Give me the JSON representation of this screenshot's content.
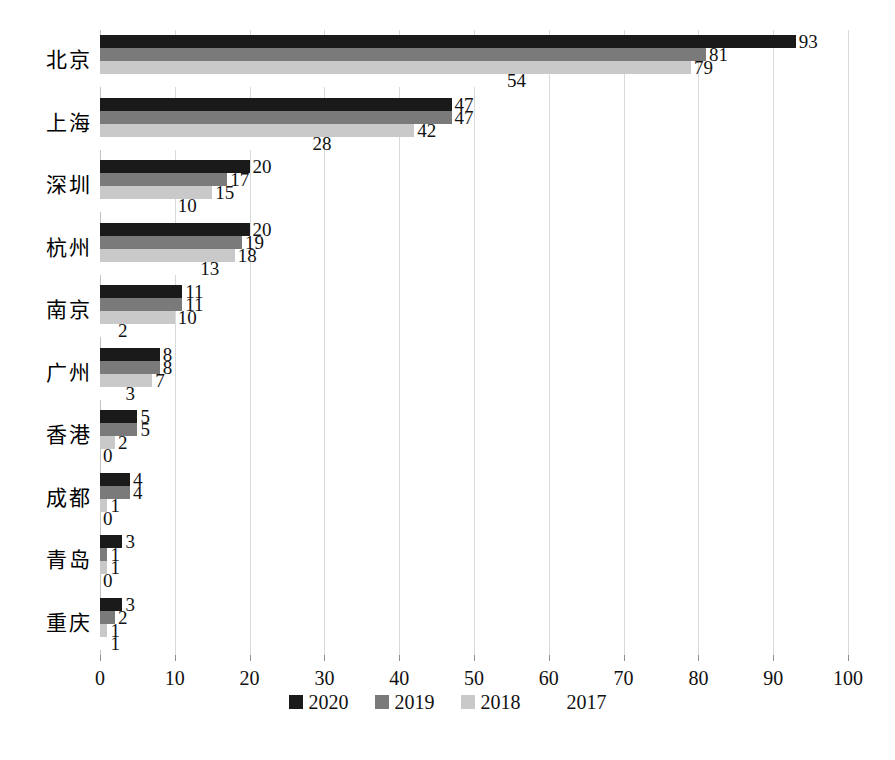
{
  "chart_data": {
    "type": "bar",
    "orientation": "horizontal",
    "title": "",
    "subtitle": "",
    "xlabel": "",
    "ylabel": "",
    "xlim": [
      0,
      100
    ],
    "xticks": [
      0,
      10,
      20,
      30,
      40,
      50,
      60,
      70,
      80,
      90,
      100
    ],
    "grid": true,
    "legend_position": "bottom",
    "categories": [
      "北京",
      "上海",
      "深圳",
      "杭州",
      "南京",
      "广州",
      "香港",
      "成都",
      "青岛",
      "重庆"
    ],
    "series": [
      {
        "name": "2020",
        "color": "#1a1a1a",
        "values": [
          93,
          47,
          20,
          20,
          11,
          8,
          5,
          4,
          3,
          3
        ]
      },
      {
        "name": "2019",
        "color": "#7a7a7a",
        "values": [
          81,
          47,
          17,
          19,
          11,
          8,
          5,
          4,
          1,
          2
        ]
      },
      {
        "name": "2018",
        "color": "#c9c9c9",
        "values": [
          79,
          42,
          15,
          18,
          10,
          7,
          2,
          1,
          1,
          1
        ]
      },
      {
        "name": "2017",
        "color": "#ffffff",
        "values": [
          54,
          28,
          10,
          13,
          2,
          3,
          0,
          0,
          0,
          1
        ]
      }
    ]
  },
  "legend": {
    "items": [
      {
        "label": "2020",
        "swatch": "black-square"
      },
      {
        "label": "2019",
        "swatch": "dark-gray-square"
      },
      {
        "label": "2018",
        "swatch": "light-gray-square"
      },
      {
        "label": "2017",
        "swatch": "blank-square"
      }
    ]
  },
  "caption": ""
}
